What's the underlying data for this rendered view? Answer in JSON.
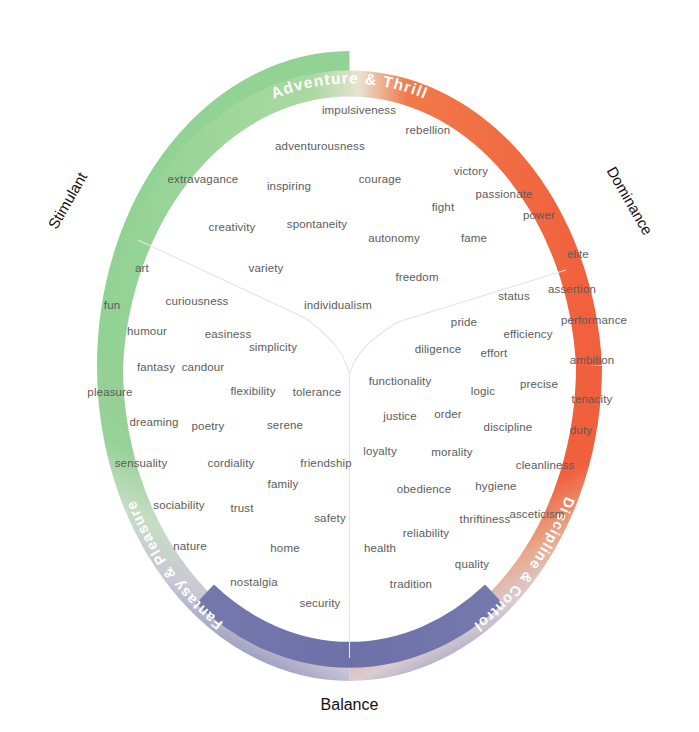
{
  "colors": {
    "green": "#92d294",
    "orange": "#f0603c",
    "purple": "#7478ad",
    "ring_label_text": "#ffffff",
    "axis_label_text": "#111111",
    "word_text": "#5b5b5b",
    "background": "#ffffff",
    "divider": "#e8e6e2"
  },
  "ring_labels": [
    {
      "id": "adventure-thrill",
      "text": "Adventure & Thrill",
      "position": "top"
    },
    {
      "id": "discipline-control",
      "text": "Discipline & Control",
      "position": "bottom-right"
    },
    {
      "id": "fantasy-pleasure",
      "text": "Fantasy & Pleasure",
      "position": "bottom-left"
    }
  ],
  "axis_labels": [
    {
      "id": "stimulant",
      "text": "Stimulant",
      "position": "left"
    },
    {
      "id": "dominance",
      "text": "Dominance",
      "position": "right"
    },
    {
      "id": "balance",
      "text": "Balance",
      "position": "bottom"
    }
  ],
  "words": [
    {
      "text": "impulsiveness",
      "x": 359,
      "y": 110
    },
    {
      "text": "rebellion",
      "x": 428,
      "y": 130
    },
    {
      "text": "adventurousness",
      "x": 320,
      "y": 146
    },
    {
      "text": "extravagance",
      "x": 203,
      "y": 179
    },
    {
      "text": "inspiring",
      "x": 289,
      "y": 186
    },
    {
      "text": "courage",
      "x": 380,
      "y": 179
    },
    {
      "text": "victory",
      "x": 471,
      "y": 171
    },
    {
      "text": "passionate",
      "x": 504,
      "y": 194
    },
    {
      "text": "fight",
      "x": 443,
      "y": 207
    },
    {
      "text": "power",
      "x": 539,
      "y": 215
    },
    {
      "text": "creativity",
      "x": 232,
      "y": 227
    },
    {
      "text": "spontaneity",
      "x": 317,
      "y": 224
    },
    {
      "text": "autonomy",
      "x": 394,
      "y": 238
    },
    {
      "text": "fame",
      "x": 474,
      "y": 238
    },
    {
      "text": "elite",
      "x": 578,
      "y": 254
    },
    {
      "text": "art",
      "x": 142,
      "y": 268
    },
    {
      "text": "variety",
      "x": 266,
      "y": 268
    },
    {
      "text": "freedom",
      "x": 417,
      "y": 277
    },
    {
      "text": "assertion",
      "x": 572,
      "y": 289
    },
    {
      "text": "fun",
      "x": 112,
      "y": 305
    },
    {
      "text": "curiousness",
      "x": 197,
      "y": 301
    },
    {
      "text": "individualism",
      "x": 338,
      "y": 305
    },
    {
      "text": "status",
      "x": 514,
      "y": 296
    },
    {
      "text": "pride",
      "x": 464,
      "y": 322
    },
    {
      "text": "performance",
      "x": 594,
      "y": 320
    },
    {
      "text": "humour",
      "x": 147,
      "y": 331
    },
    {
      "text": "easiness",
      "x": 228,
      "y": 334
    },
    {
      "text": "efficiency",
      "x": 528,
      "y": 334
    },
    {
      "text": "simplicity",
      "x": 273,
      "y": 347
    },
    {
      "text": "diligence",
      "x": 438,
      "y": 349
    },
    {
      "text": "effort",
      "x": 494,
      "y": 353
    },
    {
      "text": "fantasy",
      "x": 156,
      "y": 367
    },
    {
      "text": "candour",
      "x": 203,
      "y": 367
    },
    {
      "text": "ambition",
      "x": 592,
      "y": 360
    },
    {
      "text": "flexibility",
      "x": 253,
      "y": 391
    },
    {
      "text": "tolerance",
      "x": 317,
      "y": 392
    },
    {
      "text": "functionality",
      "x": 400,
      "y": 381
    },
    {
      "text": "logic",
      "x": 483,
      "y": 391
    },
    {
      "text": "precise",
      "x": 539,
      "y": 384
    },
    {
      "text": "pleasure",
      "x": 110,
      "y": 392
    },
    {
      "text": "tenacity",
      "x": 592,
      "y": 399
    },
    {
      "text": "dreaming",
      "x": 154,
      "y": 422
    },
    {
      "text": "poetry",
      "x": 208,
      "y": 426
    },
    {
      "text": "serene",
      "x": 285,
      "y": 425
    },
    {
      "text": "justice",
      "x": 400,
      "y": 416
    },
    {
      "text": "order",
      "x": 448,
      "y": 414
    },
    {
      "text": "discipline",
      "x": 508,
      "y": 427
    },
    {
      "text": "duty",
      "x": 581,
      "y": 430
    },
    {
      "text": "loyalty",
      "x": 380,
      "y": 451
    },
    {
      "text": "morality",
      "x": 452,
      "y": 452
    },
    {
      "text": "sensuality",
      "x": 141,
      "y": 463
    },
    {
      "text": "cordiality",
      "x": 231,
      "y": 463
    },
    {
      "text": "friendship",
      "x": 326,
      "y": 463
    },
    {
      "text": "cleanliness",
      "x": 545,
      "y": 465
    },
    {
      "text": "family",
      "x": 283,
      "y": 484
    },
    {
      "text": "obedience",
      "x": 424,
      "y": 489
    },
    {
      "text": "hygiene",
      "x": 496,
      "y": 486
    },
    {
      "text": "sociability",
      "x": 179,
      "y": 505
    },
    {
      "text": "trust",
      "x": 242,
      "y": 508
    },
    {
      "text": "thriftiness",
      "x": 485,
      "y": 519
    },
    {
      "text": "asceticism",
      "x": 537,
      "y": 514
    },
    {
      "text": "safety",
      "x": 330,
      "y": 518
    },
    {
      "text": "reliability",
      "x": 426,
      "y": 533
    },
    {
      "text": "nature",
      "x": 190,
      "y": 546
    },
    {
      "text": "home",
      "x": 285,
      "y": 548
    },
    {
      "text": "health",
      "x": 380,
      "y": 548
    },
    {
      "text": "quality",
      "x": 472,
      "y": 564
    },
    {
      "text": "nostalgia",
      "x": 254,
      "y": 582
    },
    {
      "text": "tradition",
      "x": 411,
      "y": 584
    },
    {
      "text": "security",
      "x": 320,
      "y": 603
    }
  ]
}
